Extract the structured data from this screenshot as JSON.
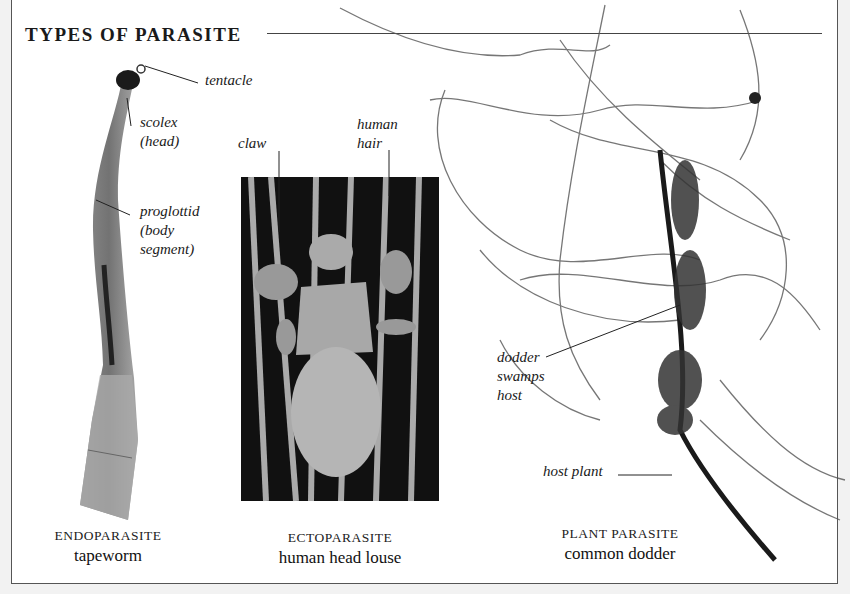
{
  "title": "TYPES OF PARASITE",
  "colors": {
    "background": "#f2f2f2",
    "panel": "#ffffff",
    "frame": "#555555",
    "text": "#1a1a1a"
  },
  "specimens": [
    {
      "category": "ENDOPARASITE",
      "name": "tapeworm",
      "image": "tapeworm-photo",
      "labels": [
        "tentacle",
        "scolex\n(head)",
        "proglottid\n(body\nsegment)"
      ]
    },
    {
      "category": "ECTOPARASITE",
      "name": "human head louse",
      "image": "louse-micrograph",
      "labels": [
        "claw",
        "human\nhair"
      ]
    },
    {
      "category": "PLANT PARASITE",
      "name": "common dodder",
      "image": "dodder-photo",
      "labels": [
        "dodder\nswamps\nhost",
        "host plant"
      ]
    }
  ]
}
